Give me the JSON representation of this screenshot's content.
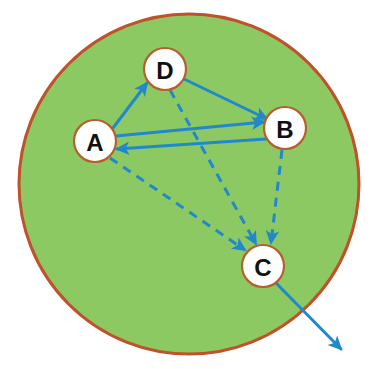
{
  "colors": {
    "region_fill": "#8dc963",
    "region_stroke": "#c0512a",
    "edge_blue": "#2288cc",
    "node_fill": "#ffffff",
    "node_stroke": "#b5602c",
    "node_text": "#111111",
    "background": "#ffffff"
  },
  "region": {
    "name": "boundary-circle",
    "cx": 189,
    "cy": 184,
    "r": 170,
    "stroke_width": 3
  },
  "nodes": [
    {
      "id": "A",
      "label": "A",
      "cx": 95,
      "cy": 141,
      "r": 21
    },
    {
      "id": "D",
      "label": "D",
      "cx": 165,
      "cy": 69,
      "r": 21
    },
    {
      "id": "B",
      "label": "B",
      "cx": 285,
      "cy": 128,
      "r": 21
    },
    {
      "id": "C",
      "label": "C",
      "cx": 263,
      "cy": 266,
      "r": 21
    }
  ],
  "edges": [
    {
      "id": "a-to-d",
      "from": "A",
      "to": "D",
      "style": "solid",
      "label": "A to D"
    },
    {
      "id": "d-to-b",
      "from": "D",
      "to": "B",
      "style": "solid",
      "label": "D to B"
    },
    {
      "id": "a-to-b",
      "from": "A",
      "to": "B",
      "style": "solid",
      "label": "A to B"
    },
    {
      "id": "b-to-a",
      "from": "B",
      "to": "A",
      "style": "solid",
      "label": "B to A"
    },
    {
      "id": "a-to-c",
      "from": "A",
      "to": "C",
      "style": "dashed",
      "label": "A to C"
    },
    {
      "id": "d-to-c",
      "from": "D",
      "to": "C",
      "style": "dashed",
      "label": "D to C"
    },
    {
      "id": "b-to-c",
      "from": "B",
      "to": "C",
      "style": "dashed",
      "label": "B to C"
    },
    {
      "id": "c-to-out",
      "from": "C",
      "to": "outside",
      "style": "solid",
      "label": "C to outside"
    }
  ],
  "edge_geometry": {
    "a-to-d": {
      "x1": 113,
      "y1": 128,
      "x2": 147,
      "y2": 83
    },
    "d-to-b": {
      "x1": 184,
      "y1": 79,
      "x2": 267,
      "y2": 119
    },
    "a-to-b": {
      "x1": 116,
      "y1": 136,
      "x2": 264,
      "y2": 122
    },
    "b-to-a": {
      "x1": 266,
      "y1": 139,
      "x2": 117,
      "y2": 149
    },
    "a-to-c": {
      "x1": 110,
      "y1": 158,
      "x2": 245,
      "y2": 250
    },
    "d-to-c": {
      "x1": 170,
      "y1": 90,
      "x2": 256,
      "y2": 244
    },
    "b-to-c": {
      "x1": 282,
      "y1": 150,
      "x2": 271,
      "y2": 243
    },
    "c-to-out": {
      "x1": 276,
      "y1": 283,
      "x2": 341,
      "y2": 349
    }
  },
  "stroke_widths": {
    "solid": 3,
    "dashed": 3
  },
  "dash_pattern": "9 7"
}
